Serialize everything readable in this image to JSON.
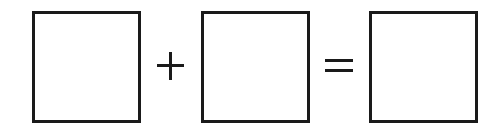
{
  "diagram": {
    "type": "equation-template",
    "boxes": [
      {
        "id": "operand-1",
        "value": ""
      },
      {
        "id": "operand-2",
        "value": ""
      },
      {
        "id": "result",
        "value": ""
      }
    ],
    "operators": {
      "first": "+",
      "second": "="
    },
    "colors": {
      "stroke": "#1a1a1a",
      "background": "#ffffff"
    }
  }
}
